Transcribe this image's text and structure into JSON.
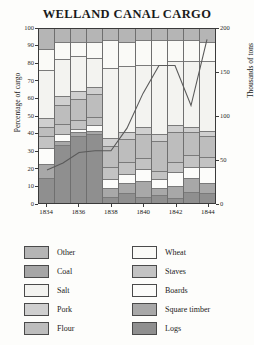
{
  "chart_data": {
    "type": "bar",
    "title": "WELLAND CANAL CARGO",
    "xlabel": "",
    "ylabel": "Percentage of cargo",
    "y2label": "Thousands of tons",
    "ylim": [
      0,
      100
    ],
    "y2lim": [
      0,
      200
    ],
    "grid": false,
    "legend_position": "bottom",
    "stacked": true,
    "stack_mode": "percent",
    "categories": [
      "1834",
      "1835",
      "1836",
      "1837",
      "1838",
      "1839",
      "1840",
      "1841",
      "1842",
      "1843",
      "1844"
    ],
    "x_tick_labels": [
      "1834",
      "1836",
      "1838",
      "1840",
      "1842",
      "1844"
    ],
    "y_tick_labels": [
      "0",
      "10",
      "20",
      "30",
      "40",
      "50",
      "60",
      "70",
      "80",
      "90",
      "100"
    ],
    "y2_tick_labels": [
      "0",
      "50",
      "100",
      "150",
      "200"
    ],
    "series": [
      {
        "name": "Logs",
        "color": "#8f8f8f",
        "values": [
          14,
          33,
          38,
          39,
          3,
          5,
          3,
          4,
          2,
          6,
          5
        ]
      },
      {
        "name": "Square timber",
        "color": "#a8a8a8",
        "values": [
          8,
          2,
          2,
          2,
          5,
          6,
          9,
          4,
          7,
          8,
          6
        ]
      },
      {
        "name": "Boards",
        "color": "#fcfcfa",
        "values": [
          9,
          4,
          2,
          3,
          5,
          5,
          7,
          5,
          8,
          6,
          9
        ]
      },
      {
        "name": "Staves",
        "color": "#c3c3c3",
        "values": [
          7,
          6,
          5,
          5,
          7,
          7,
          6,
          5,
          6,
          7,
          6
        ]
      },
      {
        "name": "Flour",
        "color": "#bdbdbd",
        "values": [
          5,
          11,
          12,
          13,
          12,
          13,
          14,
          17,
          17,
          13,
          12
        ]
      },
      {
        "name": "Pork",
        "color": "#cfcfcf",
        "values": [
          5,
          5,
          5,
          4,
          5,
          4,
          4,
          4,
          4,
          3,
          3
        ]
      },
      {
        "name": "Salt",
        "color": "#f3f3f0",
        "values": [
          28,
          21,
          20,
          17,
          40,
          38,
          36,
          40,
          37,
          38,
          40
        ]
      },
      {
        "name": "Wheat",
        "color": "#fafaf7",
        "values": [
          12,
          10,
          8,
          9,
          16,
          14,
          14,
          14,
          12,
          12,
          11
        ]
      },
      {
        "name": "Other",
        "color": "#b5b5b5",
        "values": [
          12,
          8,
          8,
          8,
          7,
          8,
          7,
          7,
          7,
          7,
          8
        ]
      }
    ],
    "line_series": {
      "name": "Total tonnage",
      "color": "#5a5a5a",
      "axis": "right",
      "values": [
        38,
        46,
        58,
        60,
        60,
        86,
        126,
        158,
        158,
        112,
        188
      ]
    }
  },
  "legend": {
    "items": [
      {
        "label": "Other",
        "color": "#b5b5b5"
      },
      {
        "label": "Wheat",
        "color": "#fafaf7"
      },
      {
        "label": "Coal",
        "color": "#a6a6a6"
      },
      {
        "label": "Staves",
        "color": "#c3c3c3"
      },
      {
        "label": "Salt",
        "color": "#f3f3f0"
      },
      {
        "label": "Boards",
        "color": "#fcfcfa"
      },
      {
        "label": "Pork",
        "color": "#cfcfcf"
      },
      {
        "label": "Square timber",
        "color": "#a8a8a8"
      },
      {
        "label": "Flour",
        "color": "#bdbdbd"
      },
      {
        "label": "Logs",
        "color": "#8f8f8f"
      }
    ]
  }
}
